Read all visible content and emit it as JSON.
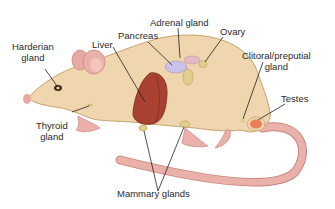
{
  "diagram": {
    "colors": {
      "body": "#efd6ae",
      "body_outline": "#c9a36a",
      "ears_tail_feet": "#e8a9a3",
      "liver": "#a8412f",
      "pancreas": "#c9c2e6",
      "adrenal": "#e2b9c4",
      "ovary": "#e2cf8f",
      "testes": "#ef7d5a",
      "lines": "#222222"
    },
    "labels": {
      "harderian_gland": [
        "Harderian",
        "gland"
      ],
      "liver": "Liver",
      "pancreas": "Pancreas",
      "adrenal_gland": "Adrenal gland",
      "ovary": "Ovary",
      "clitoral_preputial_gland": [
        "Clitoral/preputial",
        "gland"
      ],
      "testes": "Testes",
      "thyroid_gland": [
        "Thyroid",
        "gland"
      ],
      "mammary_glands": "Mammary glands"
    }
  }
}
